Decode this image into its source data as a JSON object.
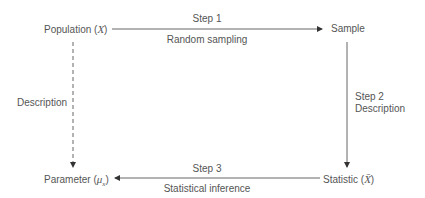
{
  "diagram": {
    "nodes": {
      "population": {
        "label": "Population (",
        "symbol": "X",
        "close": ")"
      },
      "sample": {
        "label": "Sample"
      },
      "parameter": {
        "label": "Parameter (",
        "symbol": "μ",
        "sub": "x",
        "close": ")"
      },
      "statistic": {
        "label": "Statistic (",
        "symbol": "X̄",
        "close": ")"
      }
    },
    "edges": {
      "step1": {
        "step": "Step 1",
        "desc": "Random sampling"
      },
      "step2": {
        "step": "Step 2",
        "desc": "Description"
      },
      "step3": {
        "step": "Step 3",
        "desc": "Statistical inference"
      },
      "description": {
        "desc": "Description"
      }
    },
    "colors": {
      "line": "#555555",
      "text": "#555555"
    }
  }
}
